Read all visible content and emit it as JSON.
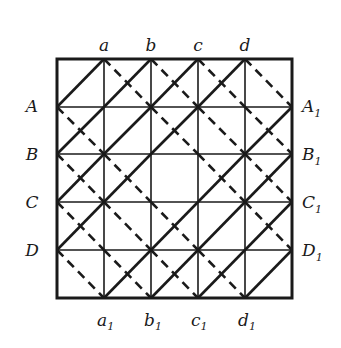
{
  "diagram": {
    "grid_size": 5,
    "colors": {
      "ink": "#1a1a1a",
      "background": "#ffffff"
    },
    "top_labels": [
      "a",
      "b",
      "c",
      "d"
    ],
    "bottom_labels": [
      {
        "base": "a",
        "sub": "1"
      },
      {
        "base": "b",
        "sub": "1"
      },
      {
        "base": "c",
        "sub": "1"
      },
      {
        "base": "d",
        "sub": "1"
      }
    ],
    "left_labels": [
      "A",
      "B",
      "C",
      "D"
    ],
    "right_labels": [
      {
        "base": "A",
        "sub": "1"
      },
      {
        "base": "B",
        "sub": "1"
      },
      {
        "base": "C",
        "sub": "1"
      },
      {
        "base": "D",
        "sub": "1"
      }
    ],
    "solid_diagonals_rising": [
      [
        0,
        1,
        2,
        3
      ],
      [
        0,
        1,
        2,
        4
      ],
      [
        0,
        1,
        3,
        4
      ],
      [
        0,
        2,
        3,
        4
      ],
      [
        1,
        2,
        3,
        4
      ]
    ],
    "dashed_diagonals_falling": [
      [
        1,
        2,
        3,
        4
      ],
      [
        0,
        2,
        3,
        4
      ],
      [
        0,
        1,
        3,
        4
      ],
      [
        0,
        1,
        2,
        4
      ],
      [
        0,
        1,
        2,
        3
      ]
    ]
  }
}
